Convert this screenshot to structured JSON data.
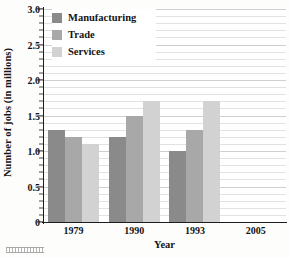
{
  "chart_data": {
    "type": "bar",
    "title": "",
    "subtitle": "",
    "xlabel": "Year",
    "ylabel": "Number of jobs (in millions)",
    "categories": [
      "1979",
      "1990",
      "1993",
      "2005"
    ],
    "series": [
      {
        "name": "Manufacturing",
        "color": "#8a8a8a",
        "values": [
          1.3,
          1.2,
          1.0,
          null
        ]
      },
      {
        "name": "Trade",
        "color": "#a8a8a8",
        "values": [
          1.2,
          1.5,
          1.3,
          null
        ]
      },
      {
        "name": "Services",
        "color": "#d2d2d2",
        "values": [
          1.1,
          1.7,
          1.7,
          null
        ]
      }
    ],
    "ylim": [
      0,
      3.0
    ],
    "ytick_labels": [
      "0",
      "0.5",
      "1.0",
      "1.5",
      "2.0",
      "2.5",
      "3.0"
    ],
    "ytick_values": [
      0,
      0.5,
      1.0,
      1.5,
      2.0,
      2.5,
      3.0
    ],
    "minor_tick_step": 0.1,
    "grid": "horizontal",
    "legend_position": "top-left-inside"
  },
  "axes": {
    "y_title": "Number of jobs (in millions)",
    "x_title": "Year"
  },
  "legend": {
    "items": [
      {
        "label": "Manufacturing",
        "color": "#8a8a8a"
      },
      {
        "label": "Trade",
        "color": "#a8a8a8"
      },
      {
        "label": "Services",
        "color": "#d2d2d2"
      }
    ]
  },
  "colors": {
    "manufacturing": "#8a8a8a",
    "trade": "#a8a8a8",
    "services": "#d2d2d2",
    "axis": "#1d1d1d",
    "gridline": "#e2e2e2",
    "gridline_major": "#cfcfcf",
    "background": "#fdfdfc"
  }
}
